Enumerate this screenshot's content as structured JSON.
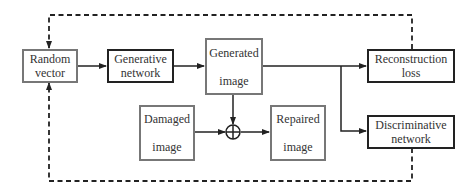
{
  "nodes": {
    "random_vector": {
      "label": "Random\nvector"
    },
    "generative_network": {
      "label": "Generative\nnetwork"
    },
    "generated_image": {
      "label": "Generated\n\nimage"
    },
    "reconstruction_loss": {
      "label": "Reconstruction\nloss"
    },
    "damaged_image": {
      "label": "Damaged\n\nimage"
    },
    "repaired_image": {
      "label": "Repaired\n\nimage"
    },
    "discriminative_network": {
      "label": "Discriminative\nnetwork"
    }
  },
  "operators": {
    "combine": {
      "symbol": "⊕"
    }
  },
  "colors": {
    "dark_border": "#222222",
    "gray_border": "#777777",
    "line": "#222222"
  }
}
